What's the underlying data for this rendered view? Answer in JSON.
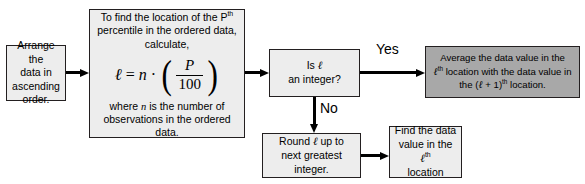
{
  "diagram": {
    "colors": {
      "box_fill": "#ededed",
      "box_fill_shaded": "#a8a8a8",
      "border": "#231f20",
      "arrow": "#000000",
      "background": "#ffffff"
    },
    "nodes": {
      "arrange": {
        "label": "Arrange the data in ascending order.",
        "lines": [
          "Arrange the",
          "data in",
          "ascending",
          "order."
        ],
        "shaded": false
      },
      "formula": {
        "top_line_1": "To find the location of the P",
        "top_sup_1": "th",
        "top_line_2": "percentile in the ordered data,",
        "top_line_3": "calculate,",
        "equation": {
          "lhs": "ℓ",
          "equals": "=",
          "n": "n",
          "dot": "·",
          "numerator": "P",
          "denominator": "100",
          "plain": "ℓ = n · (P/100)"
        },
        "bottom_line_1_a": "where ",
        "bottom_line_1_n": "n",
        "bottom_line_1_b": " is the number of",
        "bottom_line_2": "observations in the ordered data.",
        "shaded": false
      },
      "decision": {
        "line_1_a": "Is ",
        "line_1_l": "ℓ",
        "line_2": "an integer?",
        "plain": "Is ℓ an integer?",
        "shaded": false
      },
      "average": {
        "line_1": "Average the data value in the",
        "line_2_l": "ℓ",
        "line_2_sup": "th",
        "line_2_rest": " location with the data value in",
        "line_3_a": "the (",
        "line_3_l": "ℓ",
        "line_3_b": " + 1)",
        "line_3_sup": "th",
        "line_3_c": " location.",
        "plain": "Average the data value in the ℓth location with the data value in the (ℓ + 1)th location.",
        "shaded": true
      },
      "round": {
        "line_1_a": "Round ",
        "line_1_l": "ℓ",
        "line_1_b": " up to",
        "line_2": "next greatest integer.",
        "plain": "Round ℓ up to next greatest integer.",
        "shaded": false
      },
      "find": {
        "line_1": "Find the data",
        "line_2_a": "value in the ",
        "line_2_l": "ℓ",
        "line_2_sup": "th",
        "line_3": "location",
        "plain": "Find the data value in the ℓth location",
        "shaded": false
      }
    },
    "branch_labels": {
      "yes": "Yes",
      "no": "No"
    },
    "edges": [
      {
        "name": "arrange-to-formula",
        "from": "arrange",
        "to": "formula",
        "label": ""
      },
      {
        "name": "formula-to-decision",
        "from": "formula",
        "to": "decision",
        "label": ""
      },
      {
        "name": "decision-to-average",
        "from": "decision",
        "to": "average",
        "label": "Yes"
      },
      {
        "name": "decision-to-round",
        "from": "decision",
        "to": "round",
        "label": "No"
      },
      {
        "name": "round-to-find",
        "from": "round",
        "to": "find",
        "label": ""
      }
    ]
  }
}
